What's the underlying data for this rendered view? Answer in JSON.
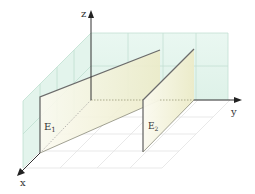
{
  "diagram": {
    "type": "3d-coordinate-planes",
    "axes": {
      "x": {
        "label": "x"
      },
      "y": {
        "label": "y"
      },
      "z": {
        "label": "z"
      }
    },
    "planes": [
      {
        "id": "E1",
        "label": "E",
        "subscript": "1"
      },
      {
        "id": "E2",
        "label": "E",
        "subscript": "2"
      }
    ],
    "colors": {
      "wall_fill": "#dff3ea",
      "wall_grid": "#c5e2d6",
      "plane_fill": "#f4f2da",
      "plane_edge": "#6b6b6b",
      "floor_grid": "#e2e2e2",
      "axis": "#333333"
    }
  }
}
